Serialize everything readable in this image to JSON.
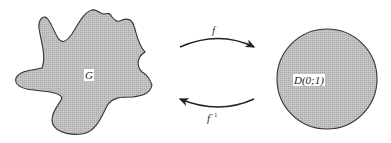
{
  "diagram": {
    "type": "conformal-mapping",
    "regions": [
      {
        "id": "G",
        "label": "G",
        "shape": "irregular-blob",
        "fill": "#bdbdbd",
        "stroke": "#333333"
      },
      {
        "id": "D",
        "label": "D(0;1)",
        "shape": "circle",
        "fill": "#bdbdbd",
        "stroke": "#333333"
      }
    ],
    "arrows": [
      {
        "label": "f",
        "from": "G",
        "to": "D(0;1)",
        "direction": "right"
      },
      {
        "label": "f",
        "label_sup": "−1",
        "from": "D(0;1)",
        "to": "G",
        "direction": "left"
      }
    ]
  }
}
